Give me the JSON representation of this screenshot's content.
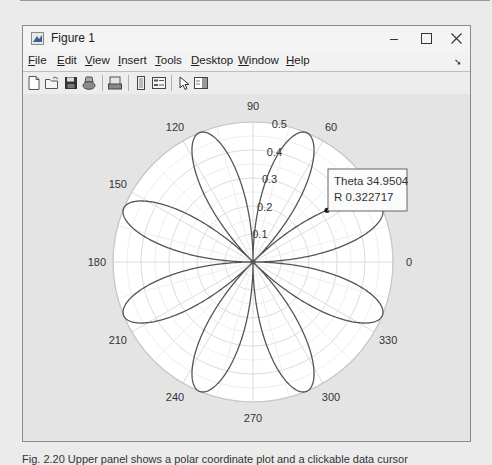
{
  "window": {
    "title": "Figure 1",
    "controls": {
      "minimize": "–",
      "maximize": "☐",
      "close": "✕"
    }
  },
  "menubar": {
    "items": [
      {
        "label": "File",
        "mnemonic": "F"
      },
      {
        "label": "Edit",
        "mnemonic": "E"
      },
      {
        "label": "View",
        "mnemonic": "V"
      },
      {
        "label": "Insert",
        "mnemonic": "I"
      },
      {
        "label": "Tools",
        "mnemonic": "T"
      },
      {
        "label": "Desktop",
        "mnemonic": "D"
      },
      {
        "label": "Window",
        "mnemonic": "W"
      },
      {
        "label": "Help",
        "mnemonic": "H"
      }
    ],
    "dock_icon": "dock-arrow-icon"
  },
  "toolbar": {
    "buttons": [
      {
        "name": "new-figure",
        "icon": "new-file-icon"
      },
      {
        "name": "open-file",
        "icon": "open-folder-icon"
      },
      {
        "name": "save-figure",
        "icon": "save-disk-icon"
      },
      {
        "name": "print-figure",
        "icon": "print-icon"
      },
      {
        "name": "link-plot",
        "icon": "link-plot-icon"
      },
      {
        "name": "insert-colorbar",
        "icon": "colorbar-icon"
      },
      {
        "name": "insert-legend",
        "icon": "legend-icon"
      },
      {
        "name": "edit-plot",
        "icon": "pointer-arrow-icon"
      },
      {
        "name": "show-plot-tools",
        "icon": "plot-tools-icon"
      }
    ]
  },
  "datatip": {
    "theta_label": "Theta",
    "theta_value": "34.9504",
    "r_label": "R",
    "r_value": "0.322717",
    "theta_line": "Theta 34.9504",
    "r_line": "R 0.322717"
  },
  "caption": "Fig. 2.20  Upper panel shows a polar coordinate plot and a clickable data cursor",
  "chart_data": {
    "type": "line",
    "subtype": "polar",
    "title": "",
    "equation_estimate": "r = 0.5 * |sin(4*theta)|",
    "theta_ticks": [
      0,
      30,
      60,
      90,
      120,
      150,
      180,
      210,
      240,
      270,
      300,
      330
    ],
    "theta_tick_labels": [
      "0",
      "30",
      "60",
      "90",
      "120",
      "150",
      "180",
      "210",
      "240",
      "270",
      "300",
      "330"
    ],
    "visible_theta_labels": [
      "0",
      "60",
      "90",
      "120",
      "150",
      "180",
      "210",
      "240",
      "270",
      "300",
      "330"
    ],
    "r_ticks": [
      0.1,
      0.2,
      0.3,
      0.4,
      0.5
    ],
    "r_tick_labels": [
      "0.1",
      "0.2",
      "0.3",
      "0.4",
      "0.5"
    ],
    "rlim": [
      0,
      0.5
    ],
    "petal_count": 8,
    "petal_angles_deg": [
      22.5,
      67.5,
      112.5,
      157.5,
      202.5,
      247.5,
      292.5,
      337.5
    ],
    "petal_max_r": 0.5,
    "data_cursor": {
      "theta": 34.9504,
      "r": 0.322717
    },
    "grid": true,
    "legend": null
  }
}
